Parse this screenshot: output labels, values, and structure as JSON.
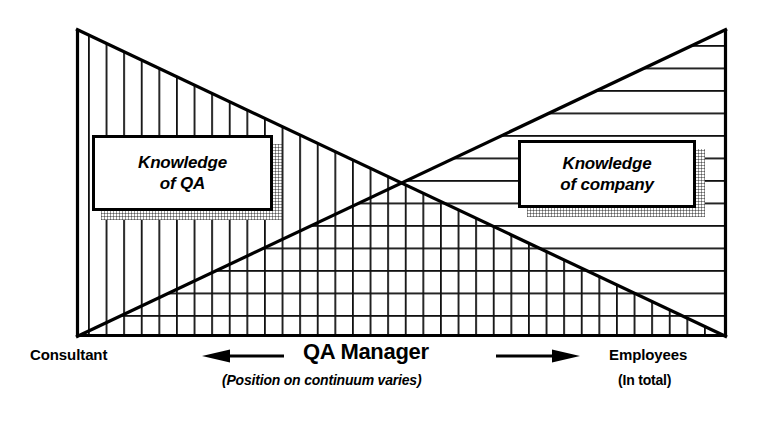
{
  "diagram": {
    "title_text_left": "Knowledge\nof QA",
    "title_text_right": "Knowledge\nof company",
    "frame": {
      "left": 76,
      "top": 29,
      "right": 727,
      "bottom": 337,
      "stroke_color": "#000000",
      "stroke_width": 3
    },
    "wedges": [
      {
        "name": "knowledge-of-qa-wedge",
        "hatch": "vertical",
        "description": "Triangle descending left-to-right: highest at left edge, zero at right edge",
        "points": "76,29 727,337 76,337"
      },
      {
        "name": "knowledge-of-company-wedge",
        "hatch": "horizontal",
        "description": "Triangle ascending left-to-right: zero at left edge, highest at right edge",
        "points": "76,337 727,29 727,337"
      }
    ],
    "crossing_point": {
      "x": 402,
      "y": 183
    },
    "boxes": [
      {
        "name": "knowledge-of-qa-box",
        "left": 92,
        "top": 135,
        "width": 181,
        "height": 76
      },
      {
        "name": "knowledge-of-company-box",
        "left": 518,
        "top": 140,
        "width": 178,
        "height": 68
      }
    ]
  },
  "captions": {
    "left_label": "Consultant",
    "center_label": "QA Manager",
    "center_sublabel": "(Position on continuum varies)",
    "right_label": "Employees",
    "right_sublabel": "(In total)",
    "left_arrow_icon": "arrow-left-icon",
    "right_arrow_icon": "arrow-right-icon"
  },
  "colors": {
    "ink": "#000000",
    "paper": "#ffffff",
    "hatch": "#1a1a1a",
    "shadow": "#b8b8b8"
  }
}
